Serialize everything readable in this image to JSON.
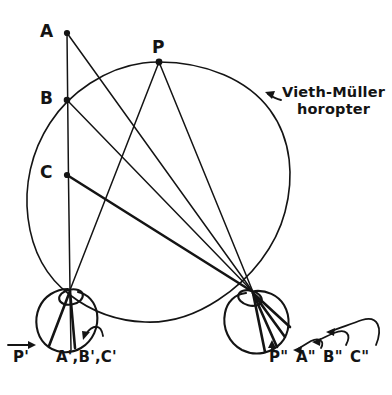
{
  "figure": {
    "background_color": "#ffffff",
    "ink_color": "#141414",
    "width": 392,
    "height": 395
  },
  "annotation": {
    "arrow_icon": "left-arrow-glyph",
    "line1": "Vieth-Müller",
    "line2": "horopter"
  },
  "object_points": [
    {
      "id": "A",
      "label": "A",
      "x": 67,
      "y": 33
    },
    {
      "id": "B",
      "label": "B",
      "x": 67,
      "y": 100
    },
    {
      "id": "C",
      "label": "C",
      "x": 67,
      "y": 175
    },
    {
      "id": "P",
      "label": "P",
      "x": 159,
      "y": 62
    }
  ],
  "eyes": [
    {
      "id": "left-eye",
      "side": "left",
      "nodal_x": 70,
      "nodal_y": 290,
      "center_x": 68,
      "center_y": 320,
      "radius": 29,
      "retinal_labels": [
        {
          "id": "P-prime",
          "label": "P'",
          "x": 8,
          "y": 350
        },
        {
          "id": "ABC-prime",
          "label": "A',B',C'",
          "x": 56,
          "y": 350
        }
      ]
    },
    {
      "id": "right-eye",
      "side": "right",
      "nodal_x": 253,
      "nodal_y": 292,
      "center_x": 261,
      "center_y": 322,
      "radius": 30,
      "retinal_labels": [
        {
          "id": "P-double-prime",
          "label": "P\"",
          "x": 277,
          "y": 350
        },
        {
          "id": "A-double-prime",
          "label": "A\"",
          "x": 305,
          "y": 350
        },
        {
          "id": "B-double-prime",
          "label": "B\"",
          "x": 330,
          "y": 350
        },
        {
          "id": "C-double-prime",
          "label": "C\"",
          "x": 355,
          "y": 350
        }
      ]
    }
  ],
  "horopter": {
    "name": "Vieth-Müller horopter",
    "center_x": 159,
    "center_y": 192,
    "radius": 130
  }
}
